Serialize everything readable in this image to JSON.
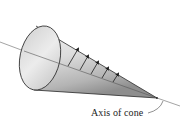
{
  "diagram": {
    "subject": "cone",
    "labels": {
      "axis": "Axis of cone"
    },
    "colors": {
      "stroke": "#2a2a2a",
      "surface_light": "#f2f2f2",
      "surface_mid": "#d6d6d6",
      "surface_dark": "#a8a8a8",
      "axis_line": "#555555",
      "arrow": "#1a1a1a"
    },
    "elements": [
      {
        "type": "axis-line"
      },
      {
        "type": "cone-base-ellipse"
      },
      {
        "type": "cone-surface"
      },
      {
        "type": "surface-arrows",
        "count": 5
      }
    ]
  }
}
